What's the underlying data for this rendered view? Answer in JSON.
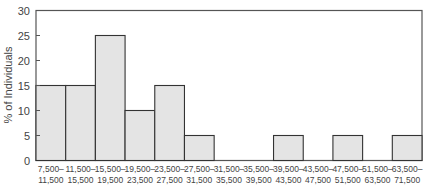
{
  "chart_data": {
    "type": "bar",
    "title": "",
    "xlabel": "",
    "ylabel": "% of Individuals",
    "ylim": [
      0,
      30
    ],
    "yticks": [
      0,
      5,
      10,
      15,
      20,
      25,
      30
    ],
    "grid": false,
    "legend": null,
    "categories": [
      [
        "7,500–",
        "11,500"
      ],
      [
        "11,500–",
        "15,500"
      ],
      [
        "15,500–",
        "19,500"
      ],
      [
        "19,500–",
        "23,500"
      ],
      [
        "23,500–",
        "27,500"
      ],
      [
        "27,500–",
        "31,500"
      ],
      [
        "31,500–",
        "35,500"
      ],
      [
        "35,500–",
        "39,500"
      ],
      [
        "39,500–",
        "43,500"
      ],
      [
        "43,500–",
        "47,500"
      ],
      [
        "47,500–",
        "51,500"
      ],
      [
        "51,500–",
        "63,500"
      ],
      [
        "63,500–",
        "71,500"
      ]
    ],
    "values": [
      15,
      15,
      25,
      10,
      15,
      5,
      0,
      0,
      5,
      0,
      5,
      0,
      5
    ],
    "bar_fill": "#e4e4e4",
    "bar_stroke": "#333333",
    "frame_color": "#555555"
  }
}
